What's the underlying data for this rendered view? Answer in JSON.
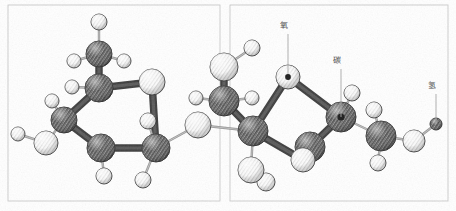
{
  "figure": {
    "kind": "ball-and-stick-molecular-model",
    "background_color": "#ffffff",
    "ink_color": "#3a3a3a"
  },
  "panels": [
    {
      "id": "panel-left",
      "x": 8,
      "y": 5,
      "width": 212,
      "height": 196
    },
    {
      "id": "panel-right",
      "x": 230,
      "y": 5,
      "width": 218,
      "height": 196
    }
  ],
  "labels": [
    {
      "id": "label-oxygen",
      "text": "氧",
      "meaning": "oxygen",
      "x": 284,
      "y": 28,
      "leader_to_x": 288,
      "leader_to_y": 74,
      "color": "#4a4a4a"
    },
    {
      "id": "label-carbon",
      "text": "碳",
      "meaning": "carbon",
      "x": 337,
      "y": 63,
      "leader_to_x": 341,
      "leader_to_y": 117,
      "color": "#4a4a4a"
    },
    {
      "id": "label-hydrogen",
      "text": "氢",
      "meaning": "hydrogen",
      "x": 432,
      "y": 88,
      "leader_to_x": 436,
      "leader_to_y": 124,
      "color": "#4a4a4a"
    }
  ],
  "atoms": [
    {
      "id": "a-h-top-oh",
      "element": "H",
      "style": "light",
      "cx": 99,
      "cy": 22,
      "r": 8
    },
    {
      "id": "a-c-upper",
      "element": "C",
      "style": "dark",
      "cx": 99,
      "cy": 54,
      "r": 13
    },
    {
      "id": "a-h-cu-left",
      "element": "H",
      "style": "light",
      "cx": 74,
      "cy": 61,
      "r": 7
    },
    {
      "id": "a-h-cu-right",
      "element": "H",
      "style": "light",
      "cx": 124,
      "cy": 61,
      "r": 7
    },
    {
      "id": "a-c-ring1-top",
      "element": "C",
      "style": "dark",
      "cx": 99,
      "cy": 88,
      "r": 14
    },
    {
      "id": "a-h-r1t-left",
      "element": "H",
      "style": "light",
      "cx": 72,
      "cy": 87,
      "r": 7
    },
    {
      "id": "a-c-ring1-tr",
      "element": "C",
      "style": "light",
      "cx": 152,
      "cy": 82,
      "r": 13
    },
    {
      "id": "a-c-ring1-bl",
      "element": "C",
      "style": "dark",
      "cx": 64,
      "cy": 120,
      "r": 13
    },
    {
      "id": "a-h-r1bl-up",
      "element": "H",
      "style": "light",
      "cx": 52,
      "cy": 101,
      "r": 7
    },
    {
      "id": "a-o-left-oh",
      "element": "O",
      "style": "light",
      "cx": 46,
      "cy": 143,
      "r": 12
    },
    {
      "id": "a-h-left-end",
      "element": "H",
      "style": "light",
      "cx": 18,
      "cy": 134,
      "r": 7
    },
    {
      "id": "a-c-ring1-bot",
      "element": "C",
      "style": "dark",
      "cx": 101,
      "cy": 148,
      "r": 14
    },
    {
      "id": "a-h-r1b-down",
      "element": "H",
      "style": "light",
      "cx": 104,
      "cy": 176,
      "r": 8
    },
    {
      "id": "a-c-ring1-br",
      "element": "C",
      "style": "dark",
      "cx": 156,
      "cy": 148,
      "r": 14
    },
    {
      "id": "a-h-r1br-up",
      "element": "H",
      "style": "light",
      "cx": 148,
      "cy": 121,
      "r": 8
    },
    {
      "id": "a-h-r1br-dn",
      "element": "H",
      "style": "light",
      "cx": 143,
      "cy": 180,
      "r": 8
    },
    {
      "id": "a-o-bridge",
      "element": "O",
      "style": "light",
      "cx": 198,
      "cy": 125,
      "r": 13
    },
    {
      "id": "a-c-fruc-1",
      "element": "C",
      "style": "dark",
      "cx": 224,
      "cy": 101,
      "r": 15
    },
    {
      "id": "a-h-f1-left",
      "element": "H",
      "style": "light",
      "cx": 196,
      "cy": 98,
      "r": 7
    },
    {
      "id": "a-h-f1-right",
      "element": "H",
      "style": "light",
      "cx": 252,
      "cy": 98,
      "r": 7
    },
    {
      "id": "a-c-fruc-top",
      "element": "C",
      "style": "light",
      "cx": 224,
      "cy": 67,
      "r": 14
    },
    {
      "id": "a-h-ftop-oh",
      "element": "H",
      "style": "light",
      "cx": 252,
      "cy": 48,
      "r": 8
    },
    {
      "id": "a-o-ring2",
      "element": "O",
      "style": "light",
      "cx": 288,
      "cy": 77,
      "r": 12,
      "center_dot": true
    },
    {
      "id": "a-c-fruc-2",
      "element": "C",
      "style": "dark",
      "cx": 253,
      "cy": 131,
      "r": 15
    },
    {
      "id": "a-c-ring2-br",
      "element": "C",
      "style": "dark",
      "cx": 310,
      "cy": 147,
      "r": 15
    },
    {
      "id": "a-h-r2br-dn",
      "element": "H",
      "style": "light",
      "cx": 266,
      "cy": 182,
      "r": 9
    },
    {
      "id": "a-o-f2-down",
      "element": "O",
      "style": "light",
      "cx": 251,
      "cy": 170,
      "r": 13
    },
    {
      "id": "a-c-ring2-tr",
      "element": "C",
      "style": "dark",
      "cx": 341,
      "cy": 117,
      "r": 15,
      "center_dot": true
    },
    {
      "id": "a-h-r2tr-up",
      "element": "H",
      "style": "light",
      "cx": 352,
      "cy": 93,
      "r": 8
    },
    {
      "id": "a-o-ring2-br",
      "element": "O",
      "style": "light",
      "cx": 303,
      "cy": 160,
      "r": 12
    },
    {
      "id": "a-c-right",
      "element": "C",
      "style": "dark",
      "cx": 381,
      "cy": 136,
      "r": 15
    },
    {
      "id": "a-h-cr-up",
      "element": "H",
      "style": "light",
      "cx": 374,
      "cy": 110,
      "r": 8
    },
    {
      "id": "a-h-cr-dn",
      "element": "H",
      "style": "light",
      "cx": 378,
      "cy": 163,
      "r": 8
    },
    {
      "id": "a-o-right-oh",
      "element": "O",
      "style": "light",
      "cx": 414,
      "cy": 141,
      "r": 11
    },
    {
      "id": "a-h-right-end",
      "element": "H",
      "style": "dark",
      "cx": 436,
      "cy": 124,
      "r": 6
    }
  ],
  "bonds": [
    {
      "from": "a-h-top-oh",
      "to": "a-c-upper",
      "weight": "thin"
    },
    {
      "from": "a-c-upper",
      "to": "a-h-cu-left",
      "weight": "thin"
    },
    {
      "from": "a-c-upper",
      "to": "a-h-cu-right",
      "weight": "thin"
    },
    {
      "from": "a-c-upper",
      "to": "a-c-ring1-top",
      "weight": "thick"
    },
    {
      "from": "a-c-ring1-top",
      "to": "a-h-r1t-left",
      "weight": "thin"
    },
    {
      "from": "a-c-ring1-top",
      "to": "a-c-ring1-tr",
      "weight": "thick"
    },
    {
      "from": "a-c-ring1-top",
      "to": "a-c-ring1-bl",
      "weight": "thick"
    },
    {
      "from": "a-c-ring1-bl",
      "to": "a-h-r1bl-up",
      "weight": "thin"
    },
    {
      "from": "a-c-ring1-bl",
      "to": "a-o-left-oh",
      "weight": "thin"
    },
    {
      "from": "a-o-left-oh",
      "to": "a-h-left-end",
      "weight": "thin"
    },
    {
      "from": "a-c-ring1-bl",
      "to": "a-c-ring1-bot",
      "weight": "thick"
    },
    {
      "from": "a-c-ring1-bot",
      "to": "a-h-r1b-down",
      "weight": "thin"
    },
    {
      "from": "a-c-ring1-bot",
      "to": "a-c-ring1-br",
      "weight": "thick"
    },
    {
      "from": "a-c-ring1-tr",
      "to": "a-c-ring1-br",
      "weight": "thick"
    },
    {
      "from": "a-c-ring1-br",
      "to": "a-h-r1br-up",
      "weight": "thin"
    },
    {
      "from": "a-c-ring1-br",
      "to": "a-h-r1br-dn",
      "weight": "thin"
    },
    {
      "from": "a-c-ring1-br",
      "to": "a-o-bridge",
      "weight": "thin"
    },
    {
      "from": "a-o-bridge",
      "to": "a-c-fruc-2",
      "weight": "thin"
    },
    {
      "from": "a-c-fruc-1",
      "to": "a-h-f1-left",
      "weight": "thin"
    },
    {
      "from": "a-c-fruc-1",
      "to": "a-h-f1-right",
      "weight": "thin"
    },
    {
      "from": "a-c-fruc-1",
      "to": "a-c-fruc-top",
      "weight": "thick"
    },
    {
      "from": "a-c-fruc-top",
      "to": "a-h-ftop-oh",
      "weight": "thin"
    },
    {
      "from": "a-c-fruc-1",
      "to": "a-c-fruc-2",
      "weight": "thick"
    },
    {
      "from": "a-c-fruc-2",
      "to": "a-o-ring2",
      "weight": "thick"
    },
    {
      "from": "a-o-ring2",
      "to": "a-c-ring2-tr",
      "weight": "thick"
    },
    {
      "from": "a-c-fruc-2",
      "to": "a-o-f2-down",
      "weight": "thin"
    },
    {
      "from": "a-o-f2-down",
      "to": "a-h-r2br-dn",
      "weight": "thin"
    },
    {
      "from": "a-c-fruc-2",
      "to": "a-o-ring2-br",
      "weight": "thick"
    },
    {
      "from": "a-o-ring2-br",
      "to": "a-c-ring2-br",
      "weight": "thick"
    },
    {
      "from": "a-c-ring2-br",
      "to": "a-c-ring2-tr",
      "weight": "thick"
    },
    {
      "from": "a-c-ring2-tr",
      "to": "a-h-r2tr-up",
      "weight": "thin"
    },
    {
      "from": "a-c-ring2-tr",
      "to": "a-c-right",
      "weight": "thin"
    },
    {
      "from": "a-c-right",
      "to": "a-h-cr-up",
      "weight": "thin"
    },
    {
      "from": "a-c-right",
      "to": "a-h-cr-dn",
      "weight": "thin"
    },
    {
      "from": "a-c-right",
      "to": "a-o-right-oh",
      "weight": "thin"
    },
    {
      "from": "a-o-right-oh",
      "to": "a-h-right-end",
      "weight": "thin"
    }
  ]
}
